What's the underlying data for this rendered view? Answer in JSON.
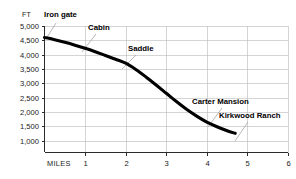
{
  "chart_data": {
    "type": "line",
    "title": "",
    "subtitle": "",
    "xlabel": "MILES",
    "ylabel": "FT",
    "xlim": [
      0,
      6
    ],
    "ylim": [
      1000,
      5000
    ],
    "grid": true,
    "legend": "none",
    "x_ticks": [
      "1",
      "2",
      "3",
      "4",
      "5",
      "6"
    ],
    "x_tick_values": [
      1,
      2,
      3,
      4,
      5,
      6
    ],
    "y_ticks": [
      "1,000",
      "1,500",
      "2,000",
      "2,500",
      "3,000",
      "3,500",
      "4,000",
      "4,500",
      "5,000"
    ],
    "y_tick_values": [
      1000,
      1500,
      2000,
      2500,
      3000,
      3500,
      4000,
      4500,
      5000
    ],
    "series": [
      {
        "name": "Trail elevation profile",
        "x": [
          0.0,
          0.25,
          0.5,
          0.75,
          1.0,
          1.25,
          1.5,
          1.75,
          2.0,
          2.25,
          2.5,
          2.75,
          3.0,
          3.25,
          3.5,
          3.75,
          4.0,
          4.25,
          4.5,
          4.7
        ],
        "y": [
          4600,
          4520,
          4430,
          4330,
          4220,
          4100,
          3970,
          3840,
          3700,
          3480,
          3220,
          2940,
          2650,
          2360,
          2090,
          1850,
          1640,
          1480,
          1340,
          1250
        ]
      }
    ],
    "annotations": [
      {
        "label": "Iron gate",
        "x": 0.0,
        "y": 4600
      },
      {
        "label": "Cabin",
        "x": 1.05,
        "y": 4190
      },
      {
        "label": "Saddle",
        "x": 2.05,
        "y": 3660
      },
      {
        "label": "Carter Mansion",
        "x": 4.05,
        "y": 1620
      },
      {
        "label": "Kirkwood Ranch",
        "x": 4.7,
        "y": 1250
      }
    ]
  },
  "axis": {
    "y_unit": "FT",
    "x_name": "MILES"
  },
  "colors": {
    "curve": "#000000",
    "grid": "#b9b9b9",
    "axis": "#2b2b2b",
    "leader": "#9a9a9a",
    "text": "#1a1a1a",
    "background": "#ffffff"
  }
}
